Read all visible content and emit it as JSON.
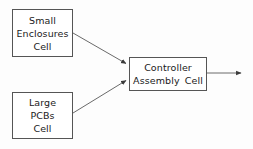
{
  "diagram": {
    "background_color": "#fdfdfd",
    "border_color": "#555555",
    "text_color": "#1a1a1a",
    "nodes": [
      {
        "id": "small-enclosures-cell",
        "lines": [
          "Small",
          "Enclosures",
          "Cell"
        ],
        "x": 12,
        "y": 9,
        "width": 61,
        "height": 48
      },
      {
        "id": "large-pcbs-cell",
        "lines": [
          "Large",
          "PCBs",
          "Cell"
        ],
        "x": 12,
        "y": 92,
        "width": 61,
        "height": 47
      },
      {
        "id": "controller-assembly-cell",
        "lines": [
          "Controller",
          "Assembly Cell"
        ],
        "x": 129,
        "y": 57,
        "width": 78,
        "height": 34
      }
    ],
    "edges": [
      {
        "id": "edge-small-enclosures-to-controller",
        "from": "small-enclosures-cell",
        "to": "controller-assembly-cell",
        "from_point": [
          73,
          33
        ],
        "to_point": [
          127,
          64
        ],
        "arrowhead": "filled-triangle"
      },
      {
        "id": "edge-large-pcbs-to-controller",
        "from": "large-pcbs-cell",
        "to": "controller-assembly-cell",
        "from_point": [
          73,
          113
        ],
        "to_point": [
          127,
          80
        ],
        "arrowhead": "filled-triangle"
      },
      {
        "id": "edge-controller-output",
        "from": "controller-assembly-cell",
        "to": null,
        "from_point": [
          207,
          73
        ],
        "to_point": [
          243,
          73
        ],
        "arrowhead": "filled-triangle"
      }
    ]
  }
}
